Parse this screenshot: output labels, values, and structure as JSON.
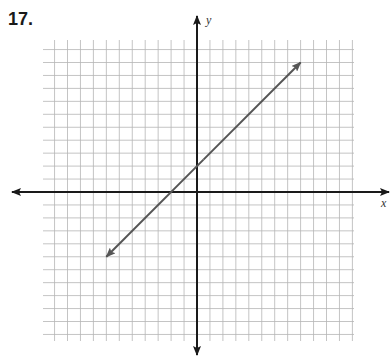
{
  "problem": {
    "number": "17."
  },
  "colors": {
    "grid": "#b5b5b5",
    "axis": "#1a1a1a",
    "line": "#555555"
  },
  "chart_data": {
    "type": "line",
    "title": "",
    "xlabel": "x",
    "ylabel": "y",
    "xlim": [
      -12,
      12
    ],
    "ylim": [
      -12,
      12
    ],
    "grid": true,
    "grid_step": 1,
    "tick_labels": false,
    "legend": null,
    "series": [
      {
        "name": "line",
        "equation": "y = x + 2",
        "slope": 1,
        "intercept": 2,
        "arrows_both_ends": true,
        "x": [
          -7,
          8
        ],
        "y": [
          -5,
          10
        ]
      }
    ]
  }
}
